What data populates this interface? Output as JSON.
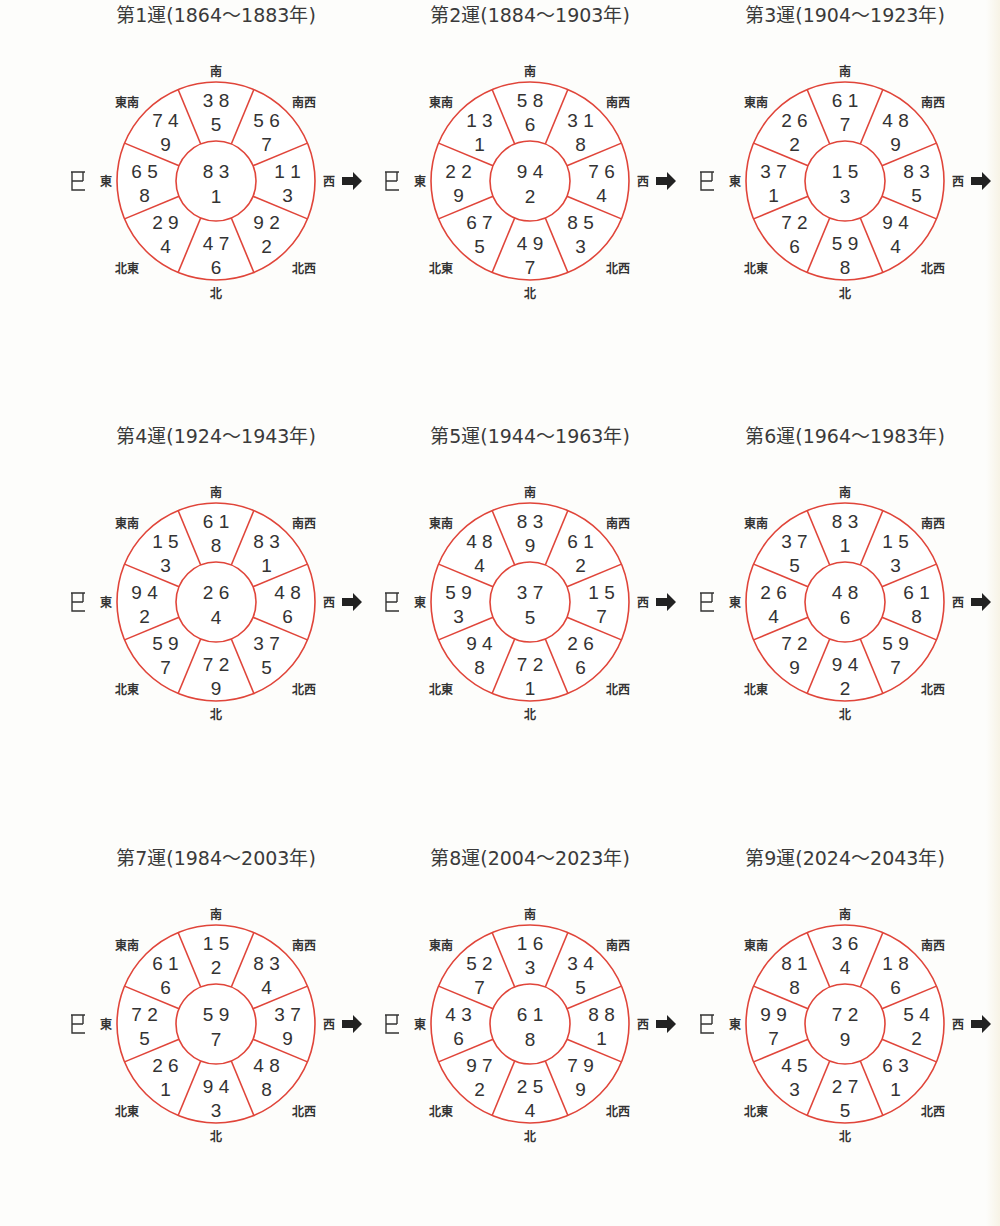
{
  "accent_color": "#e0453a",
  "text_color": "#333333",
  "directions": {
    "S": "南",
    "SW": "南西",
    "W": "西",
    "NW": "北西",
    "N": "北",
    "NE": "北東",
    "E": "東",
    "SE": "東南"
  },
  "east_symbol": "巳",
  "west_arrow": "arrow-right",
  "charts": [
    {
      "title": "第1運(1864〜1883年)",
      "center": [
        "8 3",
        "1"
      ],
      "S": [
        "3 8",
        "5"
      ],
      "SW": [
        "5 6",
        "7"
      ],
      "W": [
        "1 1",
        "3"
      ],
      "NW": [
        "9 2",
        "2"
      ],
      "N": [
        "4 7",
        "6"
      ],
      "NE": [
        "2 9",
        "4"
      ],
      "E": [
        "6 5",
        "8"
      ],
      "SE": [
        "7 4",
        "9"
      ]
    },
    {
      "title": "第2運(1884〜1903年)",
      "center": [
        "9 4",
        "2"
      ],
      "S": [
        "5 8",
        "6"
      ],
      "SW": [
        "3 1",
        "8"
      ],
      "W": [
        "7 6",
        "4"
      ],
      "NW": [
        "8 5",
        "3"
      ],
      "N": [
        "4 9",
        "7"
      ],
      "NE": [
        "6 7",
        "5"
      ],
      "E": [
        "2 2",
        "9"
      ],
      "SE": [
        "1 3",
        "1"
      ]
    },
    {
      "title": "第3運(1904〜1923年)",
      "center": [
        "1 5",
        "3"
      ],
      "S": [
        "6 1",
        "7"
      ],
      "SW": [
        "4 8",
        "9"
      ],
      "W": [
        "8 3",
        "5"
      ],
      "NW": [
        "9 4",
        "4"
      ],
      "N": [
        "5 9",
        "8"
      ],
      "NE": [
        "7 2",
        "6"
      ],
      "E": [
        "3 7",
        "1"
      ],
      "SE": [
        "2 6",
        "2"
      ]
    },
    {
      "title": "第4運(1924〜1943年)",
      "center": [
        "2 6",
        "4"
      ],
      "S": [
        "6 1",
        "8"
      ],
      "SW": [
        "8 3",
        "1"
      ],
      "W": [
        "4 8",
        "6"
      ],
      "NW": [
        "3 7",
        "5"
      ],
      "N": [
        "7 2",
        "9"
      ],
      "NE": [
        "5 9",
        "7"
      ],
      "E": [
        "9 4",
        "2"
      ],
      "SE": [
        "1 5",
        "3"
      ]
    },
    {
      "title": "第5運(1944〜1963年)",
      "center": [
        "3 7",
        "5"
      ],
      "S": [
        "8 3",
        "9"
      ],
      "SW": [
        "6 1",
        "2"
      ],
      "W": [
        "1 5",
        "7"
      ],
      "NW": [
        "2 6",
        "6"
      ],
      "N": [
        "7 2",
        "1"
      ],
      "NE": [
        "9 4",
        "8"
      ],
      "E": [
        "5 9",
        "3"
      ],
      "SE": [
        "4 8",
        "4"
      ]
    },
    {
      "title": "第6運(1964〜1983年)",
      "center": [
        "4 8",
        "6"
      ],
      "S": [
        "8 3",
        "1"
      ],
      "SW": [
        "1 5",
        "3"
      ],
      "W": [
        "6 1",
        "8"
      ],
      "NW": [
        "5 9",
        "7"
      ],
      "N": [
        "9 4",
        "2"
      ],
      "NE": [
        "7 2",
        "9"
      ],
      "E": [
        "2 6",
        "4"
      ],
      "SE": [
        "3 7",
        "5"
      ]
    },
    {
      "title": "第7運(1984〜2003年)",
      "center": [
        "5 9",
        "7"
      ],
      "S": [
        "1 5",
        "2"
      ],
      "SW": [
        "8 3",
        "4"
      ],
      "W": [
        "3 7",
        "9"
      ],
      "NW": [
        "4 8",
        "8"
      ],
      "N": [
        "9 4",
        "3"
      ],
      "NE": [
        "2 6",
        "1"
      ],
      "E": [
        "7 2",
        "5"
      ],
      "SE": [
        "6 1",
        "6"
      ]
    },
    {
      "title": "第8運(2004〜2023年)",
      "center": [
        "6 1",
        "8"
      ],
      "S": [
        "1 6",
        "3"
      ],
      "SW": [
        "3 4",
        "5"
      ],
      "W": [
        "8 8",
        "1"
      ],
      "NW": [
        "7 9",
        "9"
      ],
      "N": [
        "2 5",
        "4"
      ],
      "NE": [
        "9 7",
        "2"
      ],
      "E": [
        "4 3",
        "6"
      ],
      "SE": [
        "5 2",
        "7"
      ]
    },
    {
      "title": "第9運(2024〜2043年)",
      "center": [
        "7 2",
        "9"
      ],
      "S": [
        "3 6",
        "4"
      ],
      "SW": [
        "1 8",
        "6"
      ],
      "W": [
        "5 4",
        "2"
      ],
      "NW": [
        "6 3",
        "1"
      ],
      "N": [
        "2 7",
        "5"
      ],
      "NE": [
        "4 5",
        "3"
      ],
      "E": [
        "9 9",
        "7"
      ],
      "SE": [
        "8 1",
        "8"
      ]
    }
  ]
}
